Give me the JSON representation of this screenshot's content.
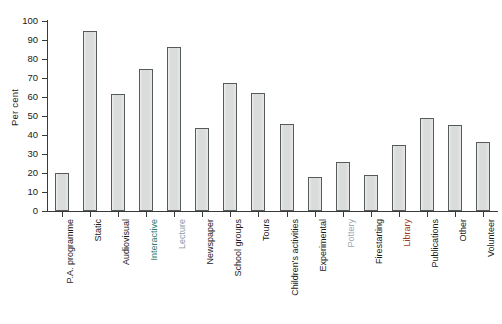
{
  "chart_data": {
    "type": "bar",
    "title": "",
    "xlabel": "",
    "ylabel": "Per cent",
    "ylim": [
      0,
      100
    ],
    "ytick_step": 10,
    "yticks": [
      0,
      10,
      20,
      30,
      40,
      50,
      60,
      70,
      80,
      90,
      100
    ],
    "grid": false,
    "legend": "none",
    "bar_fill_color": "#d9dcdb",
    "bar_edge_color": "#555b5b",
    "axis_color": "#3a3a3a",
    "categories": [
      "P.A. programme",
      "Static",
      "Audiovisual",
      "Interactive",
      "Lecture",
      "Newspaper",
      "School groups",
      "Tours",
      "Children's activities",
      "Experimental",
      "Pottery",
      "Firestarting",
      "Library",
      "Publications",
      "Other",
      "Volunteer"
    ],
    "values": [
      20,
      95,
      61.5,
      74.5,
      86.5,
      43.5,
      67.5,
      62,
      46,
      18,
      26,
      19,
      34.5,
      49,
      45.5,
      36.5
    ],
    "category_label_colors": [
      "#1a1a1a",
      "#1a1a1a",
      "#1a1a1a",
      "#2e7d73",
      "#8a98a6",
      "#1a1a1a",
      "#1a1a1a",
      "#1a1a1a",
      "#1a1a1a",
      "#1a1a1a",
      "#9aa6b2",
      "#1a1a1a",
      "#a03a2a",
      "#1a1a1a",
      "#1a1a1a",
      "#1a1a1a"
    ]
  }
}
